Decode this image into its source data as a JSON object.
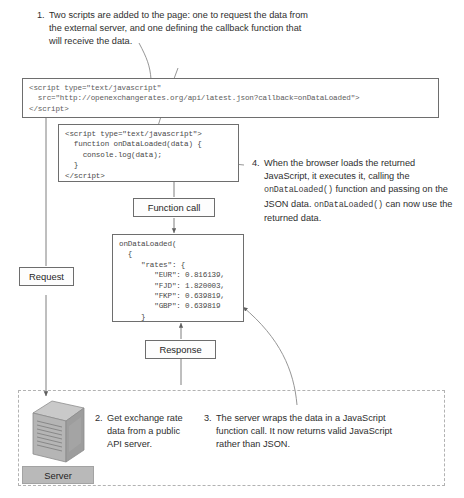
{
  "diagram": {
    "colors": {
      "line": "#6e6e6e",
      "dashed": "#b2b2b2",
      "code_text": "#5d5d5d",
      "server_label_bg": "#b9b9b9",
      "text": "#2e2e2e"
    }
  },
  "notes": {
    "note1": {
      "number": "1.",
      "text": "Two scripts are added to the page: one to request the data from the external server, and one defining the callback function that will receive the data."
    },
    "note2": {
      "number": "2.",
      "text": "Get exchange rate data from a public API server."
    },
    "note3": {
      "number": "3.",
      "text": "The server wraps the data in a JavaScript function call. It now returns valid JavaScript rather than JSON."
    },
    "note4": {
      "number": "4.",
      "part_a": "When the browser loads the returned JavaScript, it executes it, calling the ",
      "code_a": "onDataLoaded()",
      "part_b": " function and passing on the JSON data. ",
      "code_b": "onDataLoaded()",
      "part_c": " can now use the returned data."
    }
  },
  "code_blocks": {
    "request_script": "<script type=\"text/javascript\"\n  src=\"http://openexchangerates.org/api/latest.json?callback=onDataLoaded\">\n</script>",
    "callback_script": "<script type=\"text/javascript\">\n  function onDataLoaded(data) {\n    console.log(data);\n  }\n</script>",
    "response_payload": "onDataLoaded(\n  {\n     \"rates\": {\n        \"EUR\": 0.816139,\n        \"FJD\": 1.820003,\n        \"FKP\": 0.639819,\n        \"GBP\": 0.639819\n     }\n  }\n)"
  },
  "labels": {
    "function_call": "Function call",
    "request": "Request",
    "response": "Response",
    "server": "Server"
  },
  "payload_data": {
    "callback_name": "onDataLoaded",
    "key": "rates",
    "rates": [
      {
        "currency": "EUR",
        "value": "0.816139"
      },
      {
        "currency": "FJD",
        "value": "1.820003"
      },
      {
        "currency": "FKP",
        "value": "0.639819"
      },
      {
        "currency": "GBP",
        "value": "0.639819"
      }
    ]
  },
  "api": {
    "url": "http://openexchangerates.org/api/latest.json?callback=onDataLoaded",
    "host": "openexchangerates.org",
    "callback_param": "onDataLoaded"
  }
}
